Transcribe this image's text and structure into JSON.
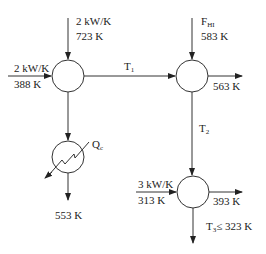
{
  "diagram": {
    "type": "heat-exchanger-network",
    "nodes": [
      {
        "id": "mixer1",
        "kind": "mixer"
      },
      {
        "id": "mixer2",
        "kind": "mixer"
      },
      {
        "id": "mixer3",
        "kind": "mixer"
      },
      {
        "id": "cooler",
        "kind": "heat-exchanger"
      }
    ],
    "streams": {
      "mixer1_top_in": {
        "flow": "2 kW/K",
        "temp": "723 K"
      },
      "mixer1_left_in": {
        "flow": "2 kW/K",
        "temp": "388 K"
      },
      "t1_label": "T",
      "t1_sub": "1",
      "mixer2_top_in": {
        "flow_main": "F",
        "flow_sub": "HI",
        "temp": "583 K"
      },
      "mixer2_right_out": {
        "temp": "563 K"
      },
      "t2_label": "T",
      "t2_sub": "2",
      "cooler_duty_main": "Q",
      "cooler_duty_sub": "c",
      "cooler_out": {
        "temp": "553 K"
      },
      "mixer3_left_in": {
        "flow": "3 kW/K",
        "temp": "313 K"
      },
      "mixer3_right_out": {
        "temp": "393 K"
      },
      "t3_label": "T",
      "t3_sub": "3",
      "t3_constraint": "≤  323 K"
    }
  }
}
